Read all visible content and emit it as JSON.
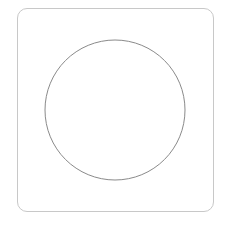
{
  "canvas": {
    "frame": {
      "stroke": "#c8c8c8",
      "radius": 10
    },
    "circle": {
      "cx": 115,
      "cy": 110,
      "r": 70,
      "stroke": "#8a8a8a"
    }
  }
}
